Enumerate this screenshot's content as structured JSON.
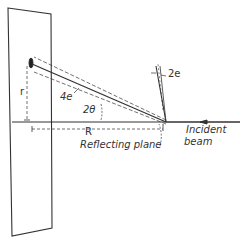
{
  "diagram": {
    "type": "x-ray reflection geometry",
    "labels": {
      "r": "r",
      "R": "R",
      "four_e": "4e",
      "two_theta": "2θ",
      "two_e": "2e",
      "reflecting_plane": "Reflecting plane",
      "incident_line1": "Incident",
      "incident_line2": "beam"
    },
    "colors": {
      "ink": "#333333",
      "background": "#ffffff"
    }
  }
}
